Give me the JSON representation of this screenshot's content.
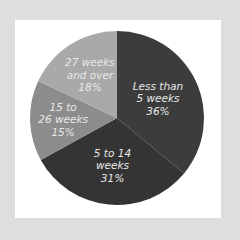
{
  "chart_data": {
    "type": "pie",
    "title": "",
    "start_angle_deg": 0,
    "direction": "clockwise",
    "slices": [
      {
        "label": "Less than 5 weeks",
        "value": 36,
        "display_label": "Less than\n5 weeks\n36%",
        "color": "#3c3c3c"
      },
      {
        "label": "5 to 14 weeks",
        "value": 31,
        "display_label": "5 to 14\nweeks\n31%",
        "color": "#343434"
      },
      {
        "label": "15 to 26 weeks",
        "value": 15,
        "display_label": "15 to\n26 weeks\n15%",
        "color": "#8c8c8c"
      },
      {
        "label": "27 weeks and over",
        "value": 18,
        "display_label": "27 weeks\nand over\n18%",
        "color": "#a9a9a9"
      }
    ],
    "legend": "none",
    "grid": false
  },
  "colors": {
    "frame": "#dedede",
    "panel": "#ffffff",
    "label_text": "#e8e8e8"
  }
}
